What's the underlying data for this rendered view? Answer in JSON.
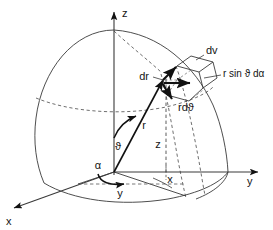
{
  "figure": {
    "background_color": "#ffffff",
    "line_color": "#3a3a3a",
    "bold_line_color": "#111111",
    "text_color": "#141414"
  },
  "axes": {
    "z": {
      "label": "z",
      "direction": "up"
    },
    "y": {
      "label": "y",
      "direction": "right"
    },
    "x": {
      "label": "x",
      "direction": "lower-left"
    }
  },
  "angles": {
    "alpha": {
      "label": "α",
      "description": "azimuthal angle in xy-plane"
    },
    "theta": {
      "label": "ϑ",
      "description": "polar angle from z-axis"
    }
  },
  "coordinates": {
    "r": {
      "label": "r",
      "description": "radial distance"
    },
    "z_projection": {
      "label": "z",
      "description": "height of point above xy-plane"
    },
    "x_projection": {
      "label": "x",
      "description": "x component in base plane"
    },
    "y_projection": {
      "label": "y",
      "description": "y component in base plane"
    }
  },
  "volume_element": {
    "name": {
      "label": "dv",
      "description": "differential volume element"
    },
    "edges": [
      {
        "label": "dr",
        "description": "radial edge length"
      },
      {
        "label": "rdϑ",
        "description": "polar arc edge length"
      },
      {
        "label": "r sin ϑ dα",
        "description": "azimuthal arc edge length"
      }
    ]
  },
  "labels": {
    "z_axis": "z",
    "y_axis": "y",
    "x_axis": "x",
    "alpha": "α",
    "theta": "ϑ",
    "r": "r",
    "z_proj": "z",
    "x_proj": "x",
    "y_proj": "y",
    "dv": "dv",
    "dr": "dr",
    "rdtheta": "rdϑ",
    "rsinthetadalpha": "r sin ϑ dα"
  }
}
